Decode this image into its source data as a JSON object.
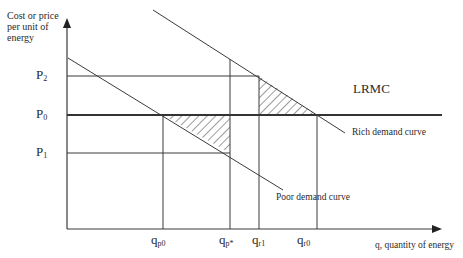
{
  "diagram": {
    "y_axis_label": "Cost or price per unit of energy",
    "x_axis_label": "q, quantity of energy",
    "price_levels": [
      {
        "id": "P2",
        "base": "P",
        "sub": "2"
      },
      {
        "id": "P0",
        "base": "P",
        "sub": "0"
      },
      {
        "id": "P1",
        "base": "P",
        "sub": "1"
      }
    ],
    "quantity_levels": [
      {
        "id": "qp0",
        "base": "q",
        "sub": "p0"
      },
      {
        "id": "qp*",
        "base": "q",
        "sub": "p*"
      },
      {
        "id": "qr1",
        "base": "q",
        "sub": "r1"
      },
      {
        "id": "qr0",
        "base": "q",
        "sub": "r0"
      }
    ],
    "curves": {
      "lrmc_label": "LRMC",
      "rich_label": "Rich demand curve",
      "poor_label": "Poor demand curve"
    },
    "colors": {
      "line": "#3a3a3a",
      "text": "#2a2a2a",
      "background": "#ffffff"
    }
  }
}
